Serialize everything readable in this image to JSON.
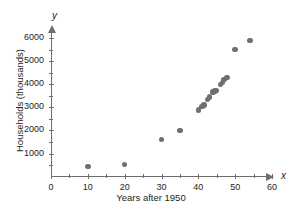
{
  "chart_data": {
    "type": "scatter",
    "title": "",
    "xlabel": "Years after 1950",
    "ylabel": "Households (thousands)",
    "x_axis_symbol": "x",
    "y_axis_symbol": "y",
    "xlim": [
      0,
      62
    ],
    "ylim": [
      0,
      6400
    ],
    "grid": false,
    "legend": null,
    "xticks_major": [
      0,
      10,
      20,
      30,
      40,
      50,
      60
    ],
    "xticks_minor": [
      5,
      15,
      25,
      35,
      45,
      55
    ],
    "yticks_major": [
      1000,
      2000,
      3000,
      4000,
      5000,
      6000
    ],
    "yticks_minor": [
      500,
      1500,
      2500,
      3500,
      4500,
      5500
    ],
    "xtick_labels": [
      "0",
      "10",
      "20",
      "30",
      "40",
      "50",
      "60"
    ],
    "ytick_labels": [
      "1000",
      "2000",
      "3000",
      "4000",
      "5000",
      "6000"
    ],
    "marker_color": "#706f6f",
    "axis_color": "#6f6e6e",
    "points": [
      {
        "x": 10,
        "y": 450
      },
      {
        "x": 20,
        "y": 530
      },
      {
        "x": 30,
        "y": 1600
      },
      {
        "x": 35,
        "y": 2000
      },
      {
        "x": 40,
        "y": 2880
      },
      {
        "x": 41,
        "y": 3040
      },
      {
        "x": 41.5,
        "y": 3100
      },
      {
        "x": 42.5,
        "y": 3340
      },
      {
        "x": 43,
        "y": 3440
      },
      {
        "x": 44,
        "y": 3670
      },
      {
        "x": 44.5,
        "y": 3700
      },
      {
        "x": 45,
        "y": 3720
      },
      {
        "x": 46,
        "y": 3990
      },
      {
        "x": 46.5,
        "y": 4080
      },
      {
        "x": 47,
        "y": 4200
      },
      {
        "x": 47.8,
        "y": 4280
      },
      {
        "x": 50,
        "y": 5500
      },
      {
        "x": 54,
        "y": 5890
      }
    ]
  }
}
